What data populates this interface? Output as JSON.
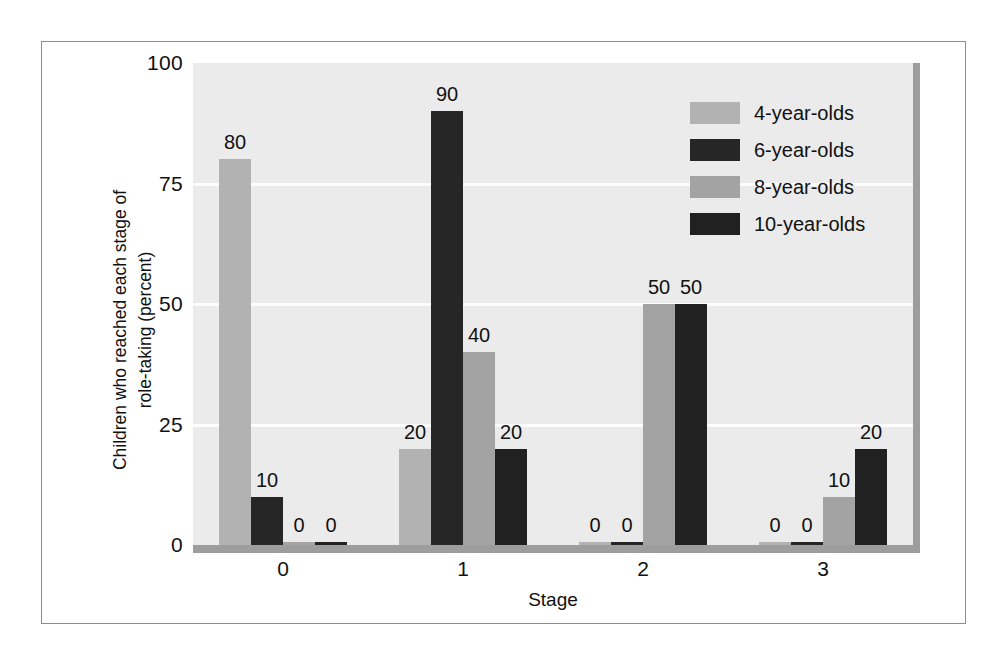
{
  "chart_data": {
    "type": "bar",
    "title": "",
    "xlabel": "Stage",
    "ylabel": "Children who reached each stage of role-taking (percent)",
    "ylabel_lines": [
      "Children who reached each stage of",
      "role-taking (percent)"
    ],
    "categories": [
      "0",
      "1",
      "2",
      "3"
    ],
    "ylim": [
      0,
      100
    ],
    "yticks": [
      "0",
      "25",
      "50",
      "75",
      "100"
    ],
    "ytick_values": [
      0,
      25,
      50,
      75,
      100
    ],
    "grid": true,
    "gridlines_at": [
      25,
      50,
      75
    ],
    "legend_position": "top-right-inside",
    "series": [
      {
        "name": "4-year-olds",
        "color": "#b2b2b2",
        "values": [
          80,
          20,
          0,
          0
        ],
        "labels": [
          "80",
          "20",
          "0",
          "0"
        ]
      },
      {
        "name": "6-year-olds",
        "color": "#262626",
        "values": [
          10,
          90,
          0,
          0
        ],
        "labels": [
          "10",
          "90",
          "0",
          "0"
        ]
      },
      {
        "name": "8-year-olds",
        "color": "#a3a3a3",
        "values": [
          0,
          40,
          50,
          10
        ],
        "labels": [
          "0",
          "40",
          "50",
          "10"
        ]
      },
      {
        "name": "10-year-olds",
        "color": "#212121",
        "values": [
          0,
          20,
          50,
          20
        ],
        "labels": [
          "0",
          "20",
          "50",
          "20"
        ]
      }
    ]
  },
  "colors": {
    "plot_background": "#ebebeb",
    "gridline": "#fdfdfd",
    "axis_bar": "#9d9d9d",
    "frame_border": "#8d8d8d",
    "text": "#111111",
    "page_background": "#ffffff"
  },
  "legend": {
    "items": [
      {
        "label": "4-year-olds",
        "color": "#b2b2b2"
      },
      {
        "label": "6-year-olds",
        "color": "#262626"
      },
      {
        "label": "8-year-olds",
        "color": "#a3a3a3"
      },
      {
        "label": "10-year-olds",
        "color": "#212121"
      }
    ]
  },
  "axes": {
    "y": {
      "title_line1": "Children who reached each stage of",
      "title_line2": "role-taking (percent)",
      "ticks": [
        {
          "label": "100",
          "value": 100
        },
        {
          "label": "75",
          "value": 75
        },
        {
          "label": "50",
          "value": 50
        },
        {
          "label": "25",
          "value": 25
        },
        {
          "label": "0",
          "value": 0
        }
      ]
    },
    "x": {
      "title": "Stage",
      "ticks": [
        {
          "label": "0"
        },
        {
          "label": "1"
        },
        {
          "label": "2"
        },
        {
          "label": "3"
        }
      ]
    }
  }
}
